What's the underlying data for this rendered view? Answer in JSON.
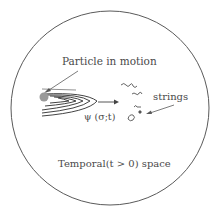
{
  "diagram": {
    "labels": {
      "particle": "Particle in motion",
      "strings": "strings",
      "wavefunction": "ψ (σ;t)",
      "space": "Temporal(t > 0) space"
    },
    "colors": {
      "stroke": "#5a5a5a",
      "text": "#4a4a4a",
      "particle": "#9a9a9a",
      "background": "#ffffff"
    }
  }
}
